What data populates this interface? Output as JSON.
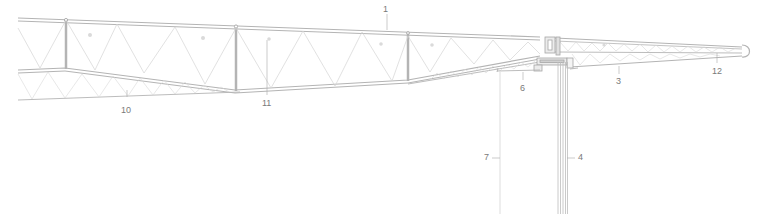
{
  "drawing": {
    "title": "Roof truss and glazing section",
    "colors": {
      "background": "#ffffff",
      "chord": "#b4b4b4",
      "chord_fill": "#e8e8e8",
      "web": "#d2d2d2",
      "glazing": "#bdbdbd",
      "leader": "#a8a8a8",
      "label": "#7a7a7a"
    }
  },
  "callouts": [
    {
      "id": "1",
      "label": "1",
      "x": 386,
      "y": 9
    },
    {
      "id": "10",
      "label": "10",
      "x": 123,
      "y": 108
    },
    {
      "id": "11",
      "label": "11",
      "x": 264,
      "y": 101
    },
    {
      "id": "6",
      "label": "6",
      "x": 523,
      "y": 86
    },
    {
      "id": "3",
      "label": "3",
      "x": 618,
      "y": 79
    },
    {
      "id": "12",
      "label": "12",
      "x": 713,
      "y": 69
    },
    {
      "id": "7",
      "label": "7",
      "x": 483,
      "y": 154
    },
    {
      "id": "4",
      "label": "4",
      "x": 580,
      "y": 154
    }
  ]
}
